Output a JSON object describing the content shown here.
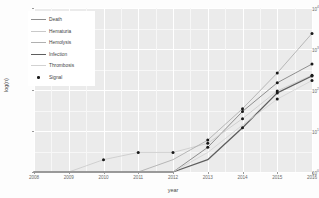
{
  "chart_data": {
    "type": "line",
    "title": "",
    "xlabel": "year",
    "ylabel": "log(n)",
    "x": [
      2008,
      2009,
      2010,
      2011,
      2012,
      2013,
      2014,
      2015,
      2016
    ],
    "xtick_labels": [
      "2008",
      "2009",
      "2010",
      "2011",
      "2012",
      "2013",
      "2014",
      "2015",
      "2016"
    ],
    "ytick_labels": [
      "10^4",
      "10^3",
      "10^2",
      "10^1",
      "10^0"
    ],
    "ylim_log10": [
      0,
      4
    ],
    "yscale": "log10",
    "grid": true,
    "legend_position": "top-left",
    "series": [
      {
        "name": "Death",
        "color": "#8f8f8f",
        "width": 1.0,
        "values": [
          1,
          1,
          1,
          1,
          1,
          4,
          30,
          150,
          430
        ]
      },
      {
        "name": "Hematuria",
        "color": "#c9c9c9",
        "width": 0.8,
        "values": [
          1,
          1,
          2,
          3,
          3,
          5,
          20,
          95,
          230
        ]
      },
      {
        "name": "Hemolysis",
        "color": "#b0b0b0",
        "width": 0.9,
        "values": [
          1,
          1,
          1,
          1,
          2,
          6,
          35,
          260,
          2400
        ]
      },
      {
        "name": "Infection",
        "color": "#5e5e5e",
        "width": 1.3,
        "values": [
          1,
          1,
          1,
          1,
          1,
          2,
          12,
          85,
          220
        ]
      },
      {
        "name": "Thrombosis",
        "color": "#d2d2d2",
        "width": 0.8,
        "values": [
          1,
          1,
          1,
          1,
          1,
          3,
          14,
          60,
          170
        ]
      }
    ],
    "signal_points": [
      {
        "year": 2010,
        "value": 2
      },
      {
        "year": 2011,
        "value": 3
      },
      {
        "year": 2012,
        "value": 3
      },
      {
        "year": 2013,
        "value": 5
      },
      {
        "year": 2013,
        "value": 6
      },
      {
        "year": 2013,
        "value": 4
      },
      {
        "year": 2014,
        "value": 35
      },
      {
        "year": 2014,
        "value": 30
      },
      {
        "year": 2014,
        "value": 20
      },
      {
        "year": 2014,
        "value": 12
      },
      {
        "year": 2015,
        "value": 260
      },
      {
        "year": 2015,
        "value": 150
      },
      {
        "year": 2015,
        "value": 95
      },
      {
        "year": 2015,
        "value": 85
      },
      {
        "year": 2015,
        "value": 60
      },
      {
        "year": 2016,
        "value": 2400
      },
      {
        "year": 2016,
        "value": 430
      },
      {
        "year": 2016,
        "value": 230
      },
      {
        "year": 2016,
        "value": 220
      },
      {
        "year": 2016,
        "value": 170
      }
    ],
    "legend": {
      "entries": [
        {
          "label": "Death",
          "marker": "line",
          "color": "#8f8f8f",
          "width": 1.0
        },
        {
          "label": "Hematuria",
          "marker": "line",
          "color": "#c9c9c9",
          "width": 0.8
        },
        {
          "label": "Hemolysis",
          "marker": "line",
          "color": "#b0b0b0",
          "width": 0.9
        },
        {
          "label": "Infection",
          "marker": "line",
          "color": "#5e5e5e",
          "width": 1.3
        },
        {
          "label": "Thrombosis",
          "marker": "line",
          "color": "#d2d2d2",
          "width": 0.8
        },
        {
          "label": "Signal",
          "marker": "dot",
          "color": "#1a1a1a",
          "width": 0
        }
      ]
    }
  },
  "theme": {
    "panel_bg": "#ebebeb",
    "grid_major": "#ffffff",
    "grid_minor": "#f7f7f7",
    "axis_text": "#6b6b6b",
    "axis_title": "#4a4a4a",
    "signal_color": "#1a1a1a"
  }
}
